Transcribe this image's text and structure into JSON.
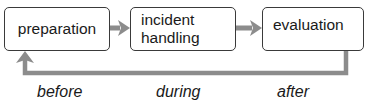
{
  "diagram": {
    "type": "process-cycle",
    "nodes": [
      {
        "id": "preparation",
        "label": "preparation"
      },
      {
        "id": "incident-handling",
        "label": "incident\nhandling"
      },
      {
        "id": "evaluation",
        "label": "evaluation"
      }
    ],
    "edges": [
      {
        "from": "preparation",
        "to": "incident-handling"
      },
      {
        "from": "incident-handling",
        "to": "evaluation"
      },
      {
        "from": "evaluation",
        "to": "preparation",
        "style": "feedback-loop"
      }
    ],
    "phases": [
      {
        "label": "before"
      },
      {
        "label": "during"
      },
      {
        "label": "after"
      }
    ],
    "colors": {
      "box_border": "#3a3a3a",
      "arrow": "#8c8c8c",
      "text": "#1a1a1a",
      "background": "#ffffff"
    }
  }
}
